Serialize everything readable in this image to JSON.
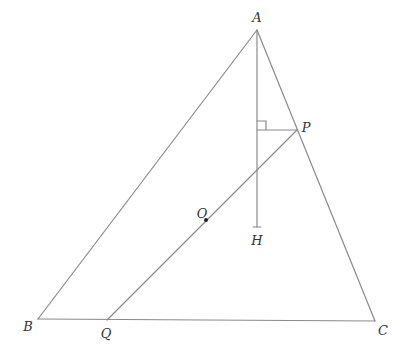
{
  "diagram": {
    "type": "geometry",
    "stroke_color": "#8a8a8a",
    "label_color": "#333333",
    "points": {
      "A": {
        "label": "A",
        "x": 257,
        "y": 30,
        "lx": 257,
        "ly": 22
      },
      "B": {
        "label": "B",
        "x": 38,
        "y": 319,
        "lx": 28,
        "ly": 331
      },
      "C": {
        "label": "C",
        "x": 375,
        "y": 321,
        "lx": 383,
        "ly": 335
      },
      "P": {
        "label": "P",
        "x": 297,
        "y": 130,
        "lx": 306,
        "ly": 132
      },
      "Q": {
        "label": "Q",
        "x": 107,
        "y": 320,
        "lx": 106,
        "ly": 338
      },
      "O": {
        "label": "O",
        "x": 206,
        "y": 220,
        "lx": 202,
        "ly": 218
      },
      "H": {
        "label": "H",
        "x": 257,
        "y": 227,
        "lx": 257,
        "ly": 245
      }
    },
    "segments": [
      {
        "name": "AB",
        "from": "A",
        "to": "B"
      },
      {
        "name": "AC",
        "from": "A",
        "to": "C"
      },
      {
        "name": "BC",
        "from": "B",
        "to": "C"
      },
      {
        "name": "AH",
        "from": "A",
        "to": "H"
      },
      {
        "name": "PQ",
        "from": "P",
        "to": "Q"
      },
      {
        "name": "P-foot",
        "from": "P",
        "to_xy": [
          257,
          130
        ]
      }
    ],
    "right_angle": {
      "at": [
        257,
        130
      ],
      "size": 9
    },
    "labels": [
      "A",
      "B",
      "C",
      "P",
      "Q",
      "O",
      "H"
    ]
  }
}
